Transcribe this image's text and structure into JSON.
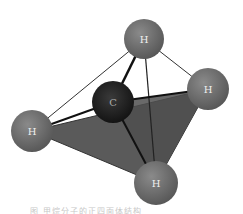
{
  "diagram": {
    "atoms": [
      {
        "id": "H_top",
        "label": "H",
        "cx": 144,
        "cy": 39,
        "r": 20,
        "color": "#6e6e6e"
      },
      {
        "id": "C_center",
        "label": "C",
        "cx": 113,
        "cy": 102,
        "r": 21,
        "color": "#1e1e1e"
      },
      {
        "id": "H_right",
        "label": "H",
        "cx": 208,
        "cy": 89,
        "r": 21,
        "color": "#707070"
      },
      {
        "id": "H_left",
        "label": "H",
        "cx": 32,
        "cy": 131,
        "r": 21,
        "color": "#6a6a6a"
      },
      {
        "id": "H_bottom",
        "label": "H",
        "cx": 156,
        "cy": 183,
        "r": 22,
        "color": "#666666"
      }
    ],
    "face_color": "#555555",
    "bond_color": "#222222",
    "edge_color": "#333333"
  },
  "caption": "图  甲烷分子的正四面体结构"
}
